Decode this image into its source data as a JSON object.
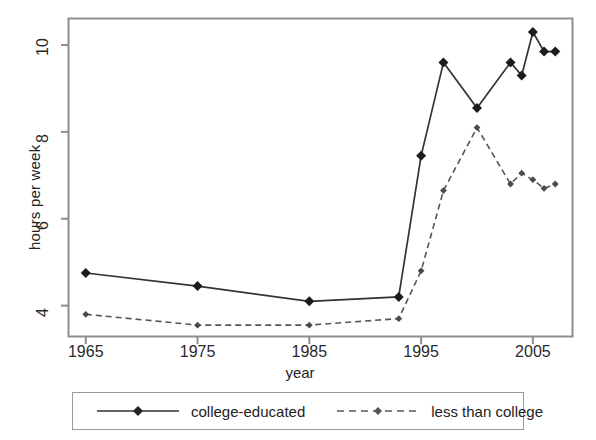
{
  "chart_data": {
    "type": "line",
    "title": "",
    "xlabel": "year",
    "ylabel": "hours per week",
    "xlim": [
      1963.5,
      2008.5
    ],
    "ylim": [
      3.3,
      10.6
    ],
    "xticks": [
      1965,
      1975,
      1985,
      1995,
      2005
    ],
    "yticks": [
      4,
      6,
      8,
      10
    ],
    "grid": false,
    "legend_position": "below",
    "x": [
      1965,
      1975,
      1985,
      1993,
      1995,
      1997,
      2000,
      2003,
      2004,
      2005,
      2006,
      2007
    ],
    "series": [
      {
        "name": "college-educated",
        "style": "solid",
        "marker": "diamond",
        "color": "#333333",
        "values": [
          4.75,
          4.45,
          4.1,
          4.2,
          7.45,
          9.6,
          8.55,
          9.6,
          9.3,
          10.3,
          9.85,
          9.85
        ]
      },
      {
        "name": "less than college",
        "style": "dashed",
        "marker": "diamond",
        "color": "#555555",
        "values": [
          3.8,
          3.55,
          3.55,
          3.7,
          4.8,
          6.65,
          8.1,
          6.8,
          7.05,
          6.9,
          6.7,
          6.8
        ]
      }
    ]
  },
  "axis": {
    "ylabel": "hours per week",
    "xlabel": "year",
    "xtick_labels": [
      "1965",
      "1975",
      "1985",
      "1995",
      "2005"
    ],
    "ytick_labels": [
      "4",
      "6",
      "8",
      "10"
    ]
  },
  "legend": {
    "entries": [
      {
        "label": "college-educated",
        "style": "solid"
      },
      {
        "label": "less than college",
        "style": "dashed"
      }
    ]
  },
  "colors": {
    "frame": "#8d8d8d",
    "series_college": "#333333",
    "series_less": "#555555",
    "text": "#222222",
    "background": "#ffffff"
  }
}
